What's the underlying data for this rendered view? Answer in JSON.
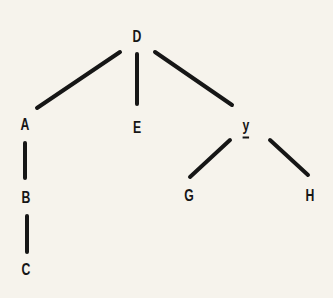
{
  "diagram": {
    "type": "tree",
    "colors": {
      "background": "#f6f3ec",
      "ink": "#161616"
    },
    "nodes": [
      {
        "id": "D",
        "label": "D",
        "x": 137,
        "y": 37
      },
      {
        "id": "A",
        "label": "A",
        "x": 25,
        "y": 125
      },
      {
        "id": "E",
        "label": "E",
        "x": 137,
        "y": 128
      },
      {
        "id": "y",
        "label": "y",
        "x": 246,
        "y": 127,
        "underlined": true
      },
      {
        "id": "B",
        "label": "B",
        "x": 26,
        "y": 198
      },
      {
        "id": "G",
        "label": "G",
        "x": 189,
        "y": 196
      },
      {
        "id": "H",
        "label": "H",
        "x": 310,
        "y": 196
      },
      {
        "id": "C",
        "label": "C",
        "x": 26,
        "y": 270
      }
    ],
    "edges": [
      {
        "from": "D",
        "to": "A",
        "x1": 120,
        "y1": 52,
        "x2": 37,
        "y2": 108
      },
      {
        "from": "D",
        "to": "E",
        "x1": 137,
        "y1": 54,
        "x2": 137,
        "y2": 104
      },
      {
        "from": "D",
        "to": "y",
        "x1": 155,
        "y1": 52,
        "x2": 232,
        "y2": 105
      },
      {
        "from": "A",
        "to": "B",
        "x1": 25,
        "y1": 143,
        "x2": 25,
        "y2": 178
      },
      {
        "from": "B",
        "to": "C",
        "x1": 27,
        "y1": 216,
        "x2": 27,
        "y2": 252
      },
      {
        "from": "y",
        "to": "G",
        "x1": 230,
        "y1": 140,
        "x2": 190,
        "y2": 177
      },
      {
        "from": "y",
        "to": "H",
        "x1": 270,
        "y1": 140,
        "x2": 308,
        "y2": 175
      }
    ]
  }
}
